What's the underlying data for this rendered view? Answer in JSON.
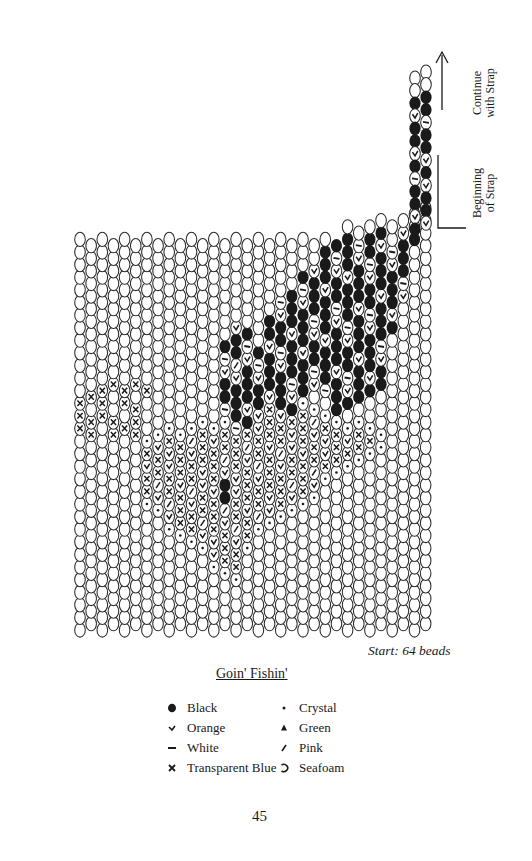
{
  "page": {
    "number": "45",
    "title": "Goin' Fishin'",
    "start_note": "Start:  64 beads"
  },
  "strap_labels": {
    "continue": [
      "Continue",
      "with Strap"
    ],
    "beginning": [
      "Beginning",
      "of Strap"
    ]
  },
  "legend": [
    {
      "symbol": "filled",
      "label": "Black",
      "column": 0
    },
    {
      "symbol": "check",
      "label": "Orange",
      "column": 0
    },
    {
      "symbol": "dash",
      "label": "White",
      "column": 0
    },
    {
      "symbol": "x",
      "label": "Transparent Blue",
      "column": 0
    },
    {
      "symbol": "dot",
      "label": "Crystal",
      "column": 1
    },
    {
      "symbol": "triangle",
      "label": "Green",
      "column": 1
    },
    {
      "symbol": "slash",
      "label": "Pink",
      "column": 1
    },
    {
      "symbol": "empty",
      "label": "Seafoam",
      "column": 1
    }
  ],
  "colors": {
    "ink": "#1a1a1a",
    "bead_outline": "#2a2a2a",
    "paper": "#ffffff"
  },
  "grid": {
    "columns": 32,
    "start_beads": 64,
    "x0": 80,
    "col_spacing": 11.15,
    "row_spacing": 12.6,
    "bottom_y": 630,
    "bead_w": 10.6,
    "bead_h": 14.2
  }
}
